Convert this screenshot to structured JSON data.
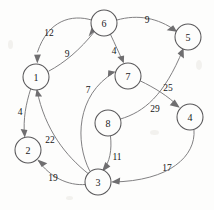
{
  "figure": {
    "background_color": "#fdfdfc",
    "node_stroke_color": "#59585a",
    "edge_stroke_color": "#7a797b",
    "label_color": "#161617"
  },
  "graph_data": {
    "type": "directed-weighted-graph",
    "node_radius": 13,
    "nodes": [
      {
        "id": "1",
        "label": "1",
        "x": 36,
        "y": 77
      },
      {
        "id": "2",
        "label": "2",
        "x": 28,
        "y": 150
      },
      {
        "id": "3",
        "label": "3",
        "x": 98,
        "y": 182
      },
      {
        "id": "4",
        "label": "4",
        "x": 190,
        "y": 117
      },
      {
        "id": "5",
        "label": "5",
        "x": 188,
        "y": 37
      },
      {
        "id": "6",
        "label": "6",
        "x": 104,
        "y": 23
      },
      {
        "id": "7",
        "label": "7",
        "x": 128,
        "y": 76
      },
      {
        "id": "8",
        "label": "8",
        "x": 108,
        "y": 123
      }
    ],
    "edges": [
      {
        "from": "6",
        "to": "1",
        "weight": "12",
        "label_x": 49,
        "label_y": 33
      },
      {
        "from": "1",
        "to": "6",
        "weight": "9",
        "label_x": 67,
        "label_y": 54
      },
      {
        "from": "6",
        "to": "5",
        "weight": "9",
        "label_x": 147,
        "label_y": 20
      },
      {
        "from": "6",
        "to": "7",
        "weight": "4",
        "label_x": 114,
        "label_y": 51
      },
      {
        "from": "3",
        "to": "7",
        "weight": "7",
        "label_x": 88,
        "label_y": 90
      },
      {
        "from": "7",
        "to": "4",
        "weight": "25",
        "label_x": 168,
        "label_y": 88
      },
      {
        "from": "8",
        "to": "5",
        "weight": "29",
        "label_x": 155,
        "label_y": 109
      },
      {
        "from": "1",
        "to": "2",
        "weight": "4",
        "label_x": 20,
        "label_y": 112
      },
      {
        "from": "3",
        "to": "1",
        "weight": "22",
        "label_x": 50,
        "label_y": 140
      },
      {
        "from": "3",
        "to": "2",
        "weight": "19",
        "label_x": 53,
        "label_y": 178
      },
      {
        "from": "8",
        "to": "3",
        "weight": "11",
        "label_x": 117,
        "label_y": 157
      },
      {
        "from": "4",
        "to": "3",
        "weight": "17",
        "label_x": 167,
        "label_y": 168
      }
    ]
  }
}
